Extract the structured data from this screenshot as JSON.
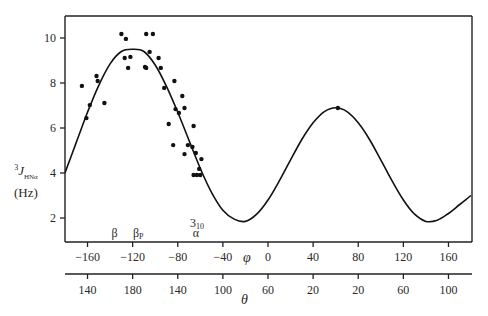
{
  "chart_data": {
    "type": "scatter",
    "title": "",
    "xlabel": "φ",
    "xlabel2": "θ",
    "ylabel": {
      "superscript": "3",
      "symbol": "J",
      "subscript": "HNα",
      "unit": "(Hz)"
    },
    "xlim": [
      -180,
      180
    ],
    "ylim": [
      1,
      11
    ],
    "grid": false,
    "legend": null,
    "y_ticks": [
      2,
      4,
      6,
      8,
      10
    ],
    "x_ticks_phi": [
      -160,
      -120,
      -80,
      -40,
      0,
      40,
      80,
      120,
      160
    ],
    "x_ticks_theta_labels": [
      "140",
      "180",
      "140",
      "100",
      "60",
      "20",
      "20",
      "60",
      "100"
    ],
    "region_labels": [
      {
        "text": "β",
        "phi": -136
      },
      {
        "text": "βP",
        "main": "β",
        "sub": "P",
        "phi": -115
      },
      {
        "text": "310",
        "main": "3",
        "sub": "10",
        "phi": -63,
        "row": "upper"
      },
      {
        "text": "α",
        "phi": -64,
        "row": "lower"
      }
    ],
    "series": [
      {
        "name": "Karplus curve",
        "kind": "line",
        "equation": "J = 6.4 cos²(φ−60) − 1.4 cos(φ−60) + 1.9",
        "x": [
          -180,
          -170,
          -160,
          -150,
          -140,
          -130,
          -120,
          -110,
          -100,
          -90,
          -80,
          -70,
          -60,
          -50,
          -40,
          -30,
          -20,
          -10,
          0,
          10,
          20,
          30,
          40,
          50,
          60,
          70,
          80,
          90,
          100,
          110,
          120,
          130,
          140,
          150,
          160,
          170,
          180
        ],
        "y": [
          4.0,
          5.35,
          6.7,
          7.9,
          8.85,
          9.4,
          9.5,
          9.4,
          8.8,
          7.85,
          6.7,
          5.45,
          4.2,
          3.13,
          2.34,
          1.95,
          1.85,
          2.17,
          2.8,
          3.65,
          4.58,
          5.49,
          6.23,
          6.73,
          6.9,
          6.73,
          6.23,
          5.49,
          4.58,
          3.65,
          2.8,
          2.17,
          1.85,
          1.9,
          2.2,
          2.6,
          3.0
        ]
      },
      {
        "name": "Measured couplings",
        "kind": "scatter",
        "points": [
          [
            -165,
            7.87
          ],
          [
            -152,
            8.31
          ],
          [
            -151,
            8.09
          ],
          [
            -158,
            7.02
          ],
          [
            -161,
            6.44
          ],
          [
            -145,
            7.11
          ],
          [
            -130,
            10.18
          ],
          [
            -126,
            9.96
          ],
          [
            -108,
            10.18
          ],
          [
            -102,
            10.18
          ],
          [
            -127,
            9.11
          ],
          [
            -122,
            9.16
          ],
          [
            -124,
            8.67
          ],
          [
            -108,
            8.67
          ],
          [
            -105,
            9.38
          ],
          [
            -97,
            9.11
          ],
          [
            -95,
            8.67
          ],
          [
            -109,
            8.71
          ],
          [
            -83,
            8.09
          ],
          [
            -92,
            7.78
          ],
          [
            -76,
            7.42
          ],
          [
            -82,
            6.84
          ],
          [
            -74,
            6.89
          ],
          [
            -79,
            6.67
          ],
          [
            -88,
            6.18
          ],
          [
            -66,
            6.09
          ],
          [
            -84,
            5.24
          ],
          [
            -71,
            5.24
          ],
          [
            -67,
            5.16
          ],
          [
            -74,
            4.84
          ],
          [
            -64,
            4.89
          ],
          [
            -59,
            4.62
          ],
          [
            -61,
            4.18
          ],
          [
            -66,
            3.91
          ],
          [
            -63,
            3.91
          ],
          [
            -60,
            3.91
          ],
          [
            62,
            6.89
          ]
        ]
      }
    ]
  },
  "labels": {
    "y_sup": "3",
    "y_sym": "J",
    "y_sub": "HNα",
    "y_unit": "(Hz)"
  }
}
